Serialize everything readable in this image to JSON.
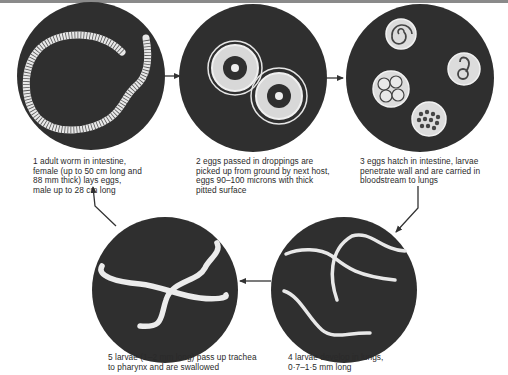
{
  "diagram": {
    "colors": {
      "disc": "#2f2f2f",
      "worm": "#eeeeee",
      "text": "#2a2a2a",
      "arrow": "#333333"
    },
    "stages": [
      {
        "id": 1,
        "icon": "adult-worm-icon",
        "caption": "1  adult worm in intestine,\nfemale (up to 50 cm long and\n88 mm thick) lays eggs,\nmale up to 28 cm long"
      },
      {
        "id": 2,
        "icon": "eggs-icon",
        "caption": "2  eggs passed in droppings are\npicked up from ground by next host,\neggs 90–100 microns with thick\npitted surface"
      },
      {
        "id": 3,
        "icon": "hatching-eggs-icon",
        "caption": "3  eggs hatch in intestine, larvae\npenetrate wall and are carried in\nbloodstream to lungs"
      },
      {
        "id": 4,
        "icon": "lung-larvae-icon",
        "caption": "4  larvae develop in lungs,\n0·7–1·5 mm long"
      },
      {
        "id": 5,
        "icon": "trachea-larvae-icon",
        "caption": "5  larvae (1–2 mm long) pass up trachea\nto pharynx and are swallowed"
      }
    ],
    "flow": [
      "1→2",
      "2→3",
      "3→4",
      "4→5",
      "5→1"
    ]
  }
}
